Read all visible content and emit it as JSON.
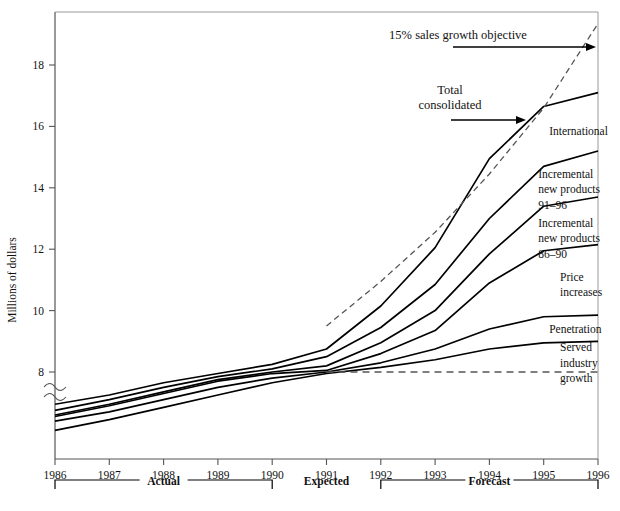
{
  "chart_data": {
    "type": "area",
    "title": "",
    "xlabel": "",
    "ylabel": "Millions of dollars",
    "x": [
      1986,
      1987,
      1988,
      1989,
      1990,
      1991,
      1992,
      1993,
      1994,
      1995,
      1996
    ],
    "xtick_labels": [
      "1986",
      "1987",
      "1988",
      "1989",
      "1990",
      "1991",
      "1992",
      "1993",
      "1994",
      "1995",
      "1996"
    ],
    "ytick_labels": [
      "8",
      "10",
      "12",
      "14",
      "16",
      "18"
    ],
    "ytick_values": [
      8,
      10,
      12,
      14,
      16,
      18
    ],
    "ylim": [
      5.6,
      19.6
    ],
    "xlim": [
      1986,
      1996
    ],
    "axis_break": true,
    "axis_break_note": "y-axis broken below 8",
    "grid": false,
    "legend_position": "inline-right-labels",
    "series": [
      {
        "name": "Total consolidated",
        "style": "solid",
        "values": [
          6.95,
          7.25,
          7.65,
          7.95,
          8.25,
          8.75,
          10.15,
          12.05,
          14.95,
          16.65,
          17.1
        ]
      },
      {
        "name": "International",
        "style": "solid",
        "values": [
          6.75,
          7.1,
          7.5,
          7.85,
          8.1,
          8.5,
          9.45,
          10.85,
          13.0,
          14.7,
          15.2
        ]
      },
      {
        "name": "Incremental new products 91-96",
        "style": "solid",
        "values": [
          6.6,
          6.95,
          7.35,
          7.75,
          8.0,
          8.2,
          8.95,
          10.0,
          11.85,
          13.4,
          13.7
        ]
      },
      {
        "name": "Incremental new products 86-90",
        "style": "solid",
        "values": [
          6.55,
          6.9,
          7.3,
          7.7,
          7.95,
          8.05,
          8.6,
          9.35,
          10.9,
          11.95,
          12.15
        ]
      },
      {
        "name": "Price increases",
        "style": "solid",
        "values": [
          6.4,
          6.7,
          7.1,
          7.5,
          7.8,
          8.0,
          8.3,
          8.75,
          9.4,
          9.8,
          9.85
        ]
      },
      {
        "name": "Penetration",
        "style": "solid",
        "values": [
          6.1,
          6.45,
          6.85,
          7.25,
          7.65,
          7.95,
          8.15,
          8.4,
          8.75,
          8.95,
          9.0
        ]
      },
      {
        "name": "Served industry growth",
        "style": "dashed-horizontal",
        "values": [
          8.0,
          8.0,
          8.0,
          8.0,
          8.0,
          8.0,
          8.0,
          8.0,
          8.0,
          8.0,
          8.0
        ],
        "dashed_from_year": 1991
      },
      {
        "name": "15% sales growth objective",
        "style": "dashed",
        "values": [
          null,
          null,
          null,
          null,
          null,
          9.5,
          10.95,
          12.55,
          14.45,
          16.6,
          19.35
        ],
        "starts_at_year": 1991
      }
    ],
    "band_labels": [
      {
        "text": "International",
        "year": 1995.1,
        "value": 15.85
      },
      {
        "text": "Incremental",
        "year": 1994.9,
        "value": 14.45
      },
      {
        "text": "new products",
        "year": 1994.9,
        "value": 13.95
      },
      {
        "text": "91–96",
        "year": 1994.9,
        "value": 13.45
      },
      {
        "text": "Incremental",
        "year": 1994.9,
        "value": 12.85
      },
      {
        "text": "new products",
        "year": 1994.9,
        "value": 12.35
      },
      {
        "text": "86–90",
        "year": 1994.9,
        "value": 11.85
      },
      {
        "text": "Price",
        "year": 1995.3,
        "value": 11.1
      },
      {
        "text": "increases",
        "year": 1995.3,
        "value": 10.6
      },
      {
        "text": "Penetration",
        "year": 1995.1,
        "value": 9.4
      },
      {
        "text": "Served",
        "year": 1995.3,
        "value": 8.8
      },
      {
        "text": "industry",
        "year": 1995.3,
        "value": 8.3
      },
      {
        "text": "growth",
        "year": 1995.3,
        "value": 7.8
      }
    ],
    "annotations": [
      {
        "text": "15% sales growth objective",
        "id": "objective-annotation"
      },
      {
        "text": "Total",
        "id": "total-consolidated-annotation-line1"
      },
      {
        "text": "consolidated",
        "id": "total-consolidated-annotation-line2"
      }
    ],
    "period_brackets": [
      {
        "label": "Actual",
        "from_year": 1986,
        "to_year": 1990
      },
      {
        "label": "Expected",
        "from_year": 1991,
        "to_year": 1991
      },
      {
        "label": "Forecast",
        "from_year": 1992,
        "to_year": 1996
      }
    ],
    "colors": {
      "line": "#000000",
      "axis": "#555555",
      "dashed": "#444444",
      "background": "#ffffff",
      "text": "#111111"
    }
  }
}
